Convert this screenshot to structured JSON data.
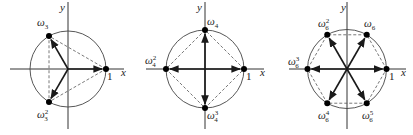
{
  "figure": {
    "panels": [
      {
        "n": 3,
        "center": [
          68,
          69
        ],
        "radius": 38,
        "axes": {
          "x": [
            10,
            124
          ],
          "y": [
            2,
            129
          ]
        },
        "axis_labels": {
          "x": {
            "text": "x",
            "pos": [
              121,
              76
            ]
          },
          "y": {
            "text": "y",
            "pos": [
              60,
              11
            ]
          }
        },
        "one_label": {
          "text": "1",
          "pos": [
            107,
            80
          ]
        },
        "roots": [
          {
            "name": "1",
            "label": "",
            "sup": "",
            "sub": "",
            "angle": 0,
            "label_pos": null
          },
          {
            "name": "omega_3",
            "label": "ω",
            "sub": "3",
            "sup": "",
            "angle": 120,
            "label_pos": [
              37,
              26
            ]
          },
          {
            "name": "omega_3^2",
            "label": "ω",
            "sub": "3",
            "sup": "2",
            "angle": 240,
            "label_pos": [
              37,
              118
            ]
          }
        ],
        "polygon_dashed": true
      },
      {
        "n": 4,
        "center": [
          205,
          69
        ],
        "radius": 39,
        "axes": {
          "x": [
            146,
            264
          ],
          "y": [
            2,
            129
          ]
        },
        "axis_labels": {
          "x": {
            "text": "x",
            "pos": [
              260,
              76
            ]
          },
          "y": {
            "text": "y",
            "pos": [
              197,
              11
            ]
          }
        },
        "one_label": {
          "text": "1",
          "pos": [
            246,
            80
          ]
        },
        "roots": [
          {
            "name": "1",
            "label": "",
            "sub": "",
            "sup": "",
            "angle": 0,
            "label_pos": null
          },
          {
            "name": "omega_4",
            "label": "ω",
            "sub": "4",
            "sup": "",
            "angle": 90,
            "label_pos": [
              207,
              25
            ]
          },
          {
            "name": "omega_4^2",
            "label": "ω",
            "sub": "4",
            "sup": "2",
            "angle": 180,
            "label_pos": [
              145,
              64
            ]
          },
          {
            "name": "omega_4^3",
            "label": "ω",
            "sub": "4",
            "sup": "3",
            "angle": 270,
            "label_pos": [
              207,
              119
            ]
          }
        ],
        "polygon_dashed": true
      },
      {
        "n": 6,
        "center": [
          347,
          69
        ],
        "radius": 39.5,
        "axes": {
          "x": [
            289,
            406
          ],
          "y": [
            2,
            129
          ]
        },
        "axis_labels": {
          "x": {
            "text": "x",
            "pos": [
              401,
              76
            ]
          },
          "y": {
            "text": "y",
            "pos": [
              341,
              11
            ]
          }
        },
        "one_label": {
          "text": "1",
          "pos": [
            389,
            80
          ]
        },
        "roots": [
          {
            "name": "1",
            "label": "",
            "sub": "",
            "sup": "",
            "angle": 0,
            "label_pos": null
          },
          {
            "name": "omega_6",
            "label": "ω",
            "sub": "6",
            "sup": "",
            "angle": 60,
            "label_pos": [
              364,
              27
            ]
          },
          {
            "name": "omega_6^2",
            "label": "ω",
            "sub": "6",
            "sup": "2",
            "angle": 120,
            "label_pos": [
              318,
              27
            ]
          },
          {
            "name": "omega_6^3",
            "label": "ω",
            "sub": "6",
            "sup": "3",
            "angle": 180,
            "label_pos": [
              288,
              65
            ]
          },
          {
            "name": "omega_6^4",
            "label": "ω",
            "sub": "6",
            "sup": "4",
            "angle": 240,
            "label_pos": [
              318,
              119
            ]
          },
          {
            "name": "omega_6^5",
            "label": "ω",
            "sub": "6",
            "sup": "5",
            "angle": 300,
            "label_pos": [
              362,
              119
            ]
          }
        ],
        "polygon_dashed": true
      }
    ]
  }
}
